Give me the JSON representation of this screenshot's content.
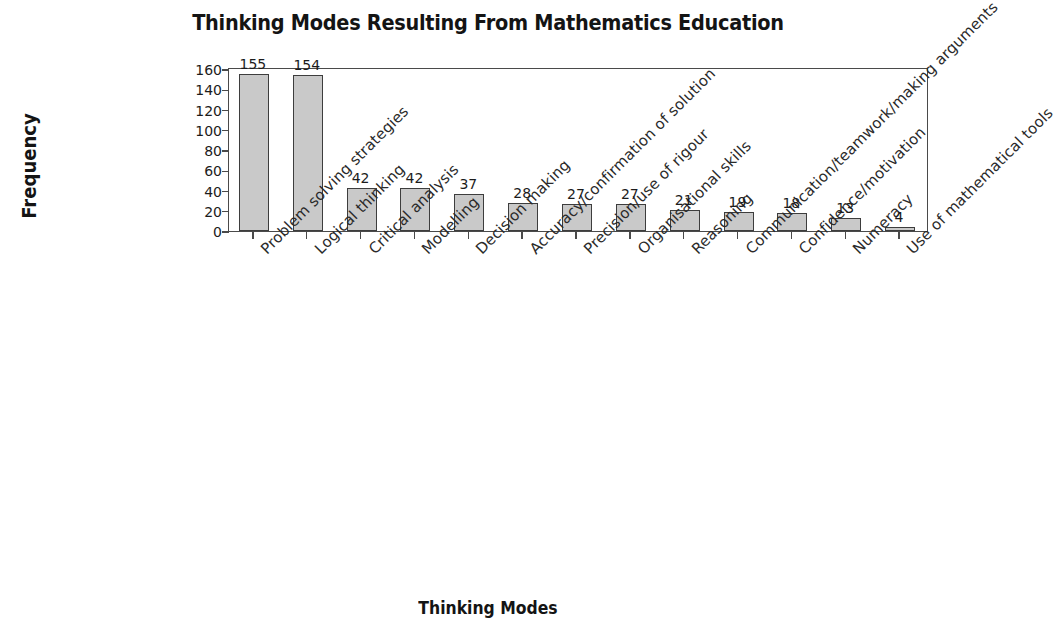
{
  "chart_data": {
    "type": "bar",
    "title": "Thinking Modes Resulting From Mathematics Education",
    "xlabel": "Thinking Modes",
    "ylabel": "Frequency",
    "ylim": [
      0,
      160
    ],
    "ytick_labels": [
      "160",
      "140",
      "120",
      "100",
      "80",
      "60",
      "40",
      "20",
      "0"
    ],
    "ytick_values": [
      160,
      140,
      120,
      100,
      80,
      60,
      40,
      20,
      0
    ],
    "grid": false,
    "legend": false,
    "categories": [
      "Problem solving strategies",
      "Logical thinking",
      "Critical analysis",
      "Modelling",
      "Decision making",
      "Accuracy/confirmation of solution",
      "Precision/use of rigour",
      "Organisational skills",
      "Reasoning",
      "Communication/teamwork/making arguments",
      "Confidence/motivation",
      "Numeracy",
      "Use of mathematical tools"
    ],
    "values": [
      155,
      154,
      42,
      42,
      37,
      28,
      27,
      27,
      21,
      19,
      18,
      13,
      4
    ],
    "bar_color": "#c9c9c9",
    "bar_border_color": "#3d3d3d",
    "axis_color": "#4a4a4a",
    "text_color": "#1c1c1c"
  }
}
